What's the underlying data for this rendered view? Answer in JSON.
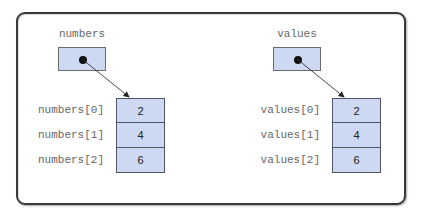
{
  "diagram": {
    "type": "array-reference-diagram",
    "colors": {
      "box_fill": "#cdd8f2",
      "box_border": "#4d5566",
      "label_text": "#666666",
      "frame_border": "#3a3a3a"
    },
    "variables": [
      {
        "name": "numbers",
        "elements": [
          {
            "index_label": "numbers[0]",
            "value": "2"
          },
          {
            "index_label": "numbers[1]",
            "value": "4"
          },
          {
            "index_label": "numbers[2]",
            "value": "6"
          }
        ]
      },
      {
        "name": "values",
        "elements": [
          {
            "index_label": "values[0]",
            "value": "2"
          },
          {
            "index_label": "values[1]",
            "value": "4"
          },
          {
            "index_label": "values[2]",
            "value": "6"
          }
        ]
      }
    ]
  }
}
